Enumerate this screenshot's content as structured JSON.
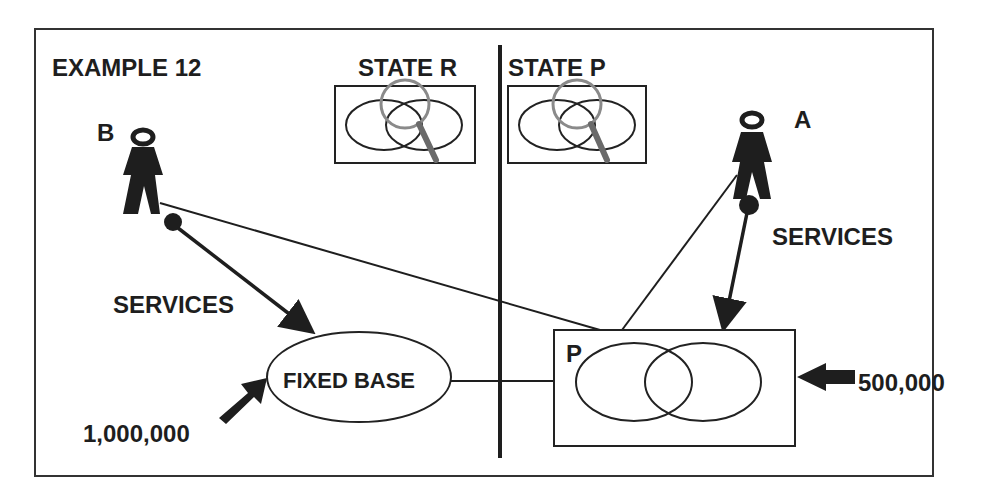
{
  "title": "EXAMPLE 12",
  "states": {
    "left": {
      "label": "STATE R"
    },
    "right": {
      "label": "STATE P"
    }
  },
  "persons": {
    "b": {
      "label": "B"
    },
    "a": {
      "label": "A"
    }
  },
  "flows": {
    "b_services": "SERVICES",
    "a_services": "SERVICES"
  },
  "nodes": {
    "fixed_base": {
      "label": "FIXED BASE"
    },
    "p_box": {
      "label": "P"
    }
  },
  "amounts": {
    "fixed_base_input": "1,000,000",
    "p_input": "500,000"
  },
  "colors": {
    "ink": "#1e1e1e",
    "background": "#ffffff",
    "magnifier_rim": "#8a8a8a"
  }
}
